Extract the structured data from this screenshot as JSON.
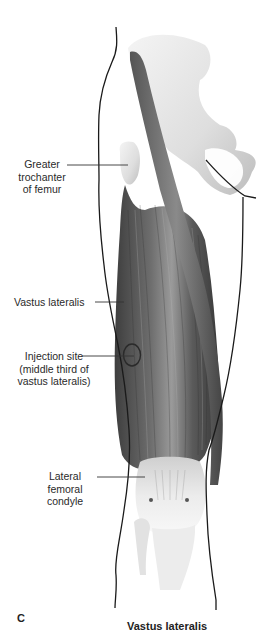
{
  "figure": {
    "panel_letter": "C",
    "caption": "Vastus lateralis"
  },
  "labels": [
    {
      "id": "greater-trochanter",
      "lines": [
        "Greater",
        "trochanter",
        "of femur"
      ]
    },
    {
      "id": "vastus-lateralis",
      "lines": [
        "Vastus lateralis"
      ]
    },
    {
      "id": "injection-site",
      "lines": [
        "Injection site",
        "(middle third of",
        "vastus lateralis)"
      ]
    },
    {
      "id": "lateral-femoral-condyle",
      "lines": [
        "Lateral femoral",
        "condyle"
      ]
    }
  ],
  "colors": {
    "outline": "#1a1a1a",
    "bone": "#e6e6e6",
    "muscle_dark": "#4a4a4a",
    "muscle_mid": "#7a7a7a",
    "leader_line": "#333333"
  }
}
